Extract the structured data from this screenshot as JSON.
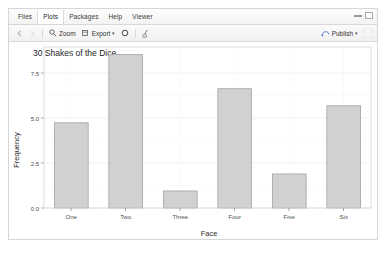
{
  "window": {
    "tabs": [
      {
        "label": "Files",
        "active": false
      },
      {
        "label": "Plots",
        "active": true
      },
      {
        "label": "Packages",
        "active": false
      },
      {
        "label": "Help",
        "active": false
      },
      {
        "label": "Viewer",
        "active": false
      }
    ],
    "pane_controls": [
      "minimize-pane",
      "maximize-pane"
    ]
  },
  "toolbar": {
    "back_icon": "left-arrow-icon",
    "forward_icon": "right-arrow-icon",
    "zoom_label": "Zoom",
    "zoom_icon": "magnifier-icon",
    "export_label": "Export",
    "export_icon": "export-icon",
    "export_caret": "▾",
    "remove_icon": "remove-plot-icon",
    "clear_all_icon": "broom-icon",
    "publish_label": "Publish",
    "publish_icon": "publish-icon",
    "publish_caret": "▾"
  },
  "chart_data": {
    "type": "bar",
    "title": "30 Shakes of the Dice",
    "xlabel": "Face",
    "ylabel": "Frequency",
    "categories": [
      "One",
      "Two",
      "Three",
      "Four",
      "Five",
      "Six"
    ],
    "values": [
      5,
      9,
      1,
      7,
      2,
      6
    ],
    "ylim": [
      0,
      9.45
    ],
    "yticks": [
      0.0,
      2.5,
      5.0,
      7.5
    ],
    "ytick_labels": [
      "0.0",
      "2.5",
      "5.0",
      "7.5"
    ],
    "grid": true,
    "legend": null,
    "bar_fill": "#d1d1d1",
    "bar_stroke": "#9a9a9a",
    "panel_background": "#ffffff"
  }
}
